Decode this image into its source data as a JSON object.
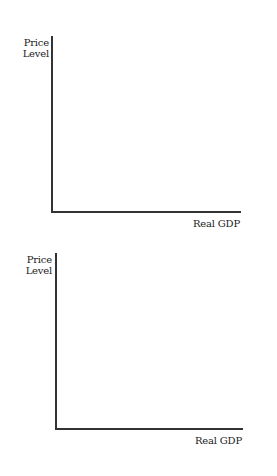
{
  "graphs": [
    {
      "y_axis_label_line1": "Price",
      "y_axis_label_line2": "Level",
      "x_axis_label": "Real GDP"
    },
    {
      "y_axis_label_line1": "Price",
      "y_axis_label_line2": "Level",
      "x_axis_label": "Real GDP"
    }
  ]
}
